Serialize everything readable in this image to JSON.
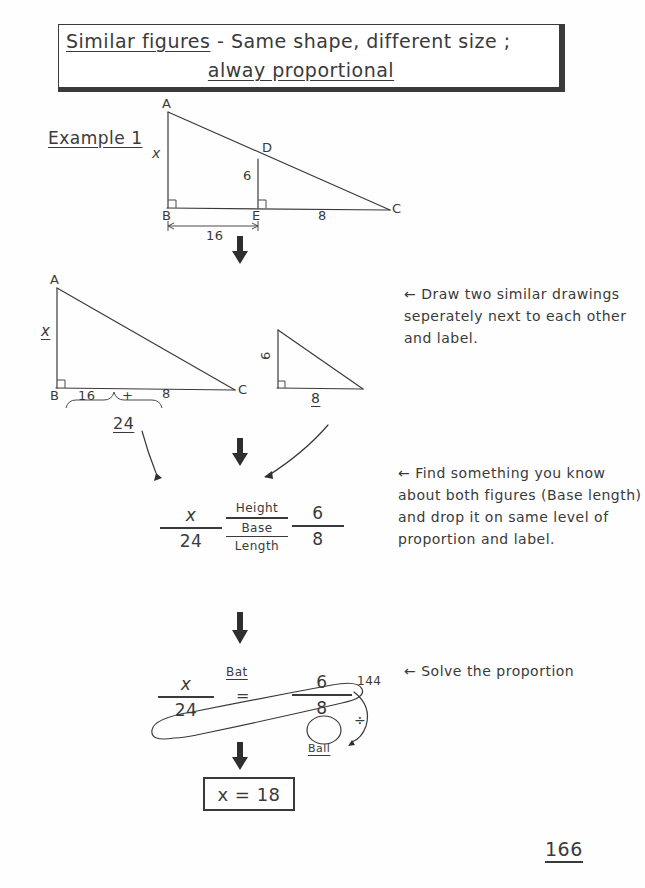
{
  "title": {
    "line1": "Similar figures - Same shape, different size ;",
    "line1_underlined_part": "Similar figures",
    "line2": "alway proportional"
  },
  "example": {
    "label": "Example 1"
  },
  "figure1": {
    "caption": "right triangle ABC with cevian DE perpendicular to BC",
    "vertices": [
      "A",
      "B",
      "C",
      "D",
      "E"
    ],
    "side_ab_label": "x",
    "segment_de_label": "6",
    "segment_be_label": "16",
    "segment_ec_label": "8"
  },
  "figure2": {
    "big_triangle": {
      "vertices": [
        "A",
        "B",
        "C"
      ],
      "height_label": "x",
      "base_part1": "16",
      "base_plus": "+",
      "base_part2": "8",
      "base_total": "24"
    },
    "small_triangle": {
      "height_label": "6",
      "base_label": "8"
    }
  },
  "notes": {
    "draw": "Draw two similar drawings seperately next to each other and label.",
    "find": "Find something you know about both figures (Base length) and drop it on same level of proportion and label.",
    "solve": "Solve the proportion",
    "arrow_glyph": "←"
  },
  "proportion": {
    "left_numerator": "x",
    "left_denominator": "24",
    "middle_numerator": "Height",
    "middle_denominator_line1": "Base",
    "middle_denominator_line2": "Length",
    "right_numerator": "6",
    "right_denominator": "8"
  },
  "cross_multiply": {
    "left_numerator": "x",
    "left_denominator": "24",
    "equals": "=",
    "right_numerator": "6",
    "right_denominator": "8",
    "bat_label": "Bat",
    "ball_label": "Ball",
    "product": "144",
    "divide_symbol": "÷"
  },
  "answer": {
    "text": "x = 18"
  },
  "page_number": "166",
  "colors": {
    "ink": "#3a3a3a",
    "paper": "#fefefe",
    "arrow": "#2f2f2f"
  }
}
